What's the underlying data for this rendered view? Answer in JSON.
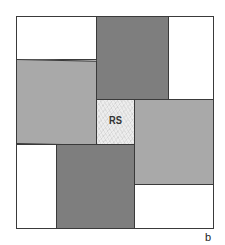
{
  "diagram": {
    "type": "pinwheel-quilt-block",
    "center_label": "RS",
    "corner_label": "b",
    "colors": {
      "white": "#ffffff",
      "dark_gray": "#7e7e7e",
      "mid_gray": "#a9a9a9",
      "center_texture": "#ededed",
      "outline": "#3a3a3a"
    },
    "pieces": [
      {
        "name": "top-left-white",
        "fill": "white"
      },
      {
        "name": "top-dark",
        "fill": "dark_gray"
      },
      {
        "name": "top-right-white",
        "fill": "white"
      },
      {
        "name": "left-mid",
        "fill": "mid_gray"
      },
      {
        "name": "center",
        "fill": "center_texture",
        "label": "RS"
      },
      {
        "name": "right-mid",
        "fill": "mid_gray"
      },
      {
        "name": "bottom-left-white",
        "fill": "white"
      },
      {
        "name": "bottom-dark",
        "fill": "dark_gray"
      },
      {
        "name": "bottom-right-white",
        "fill": "white"
      }
    ]
  }
}
